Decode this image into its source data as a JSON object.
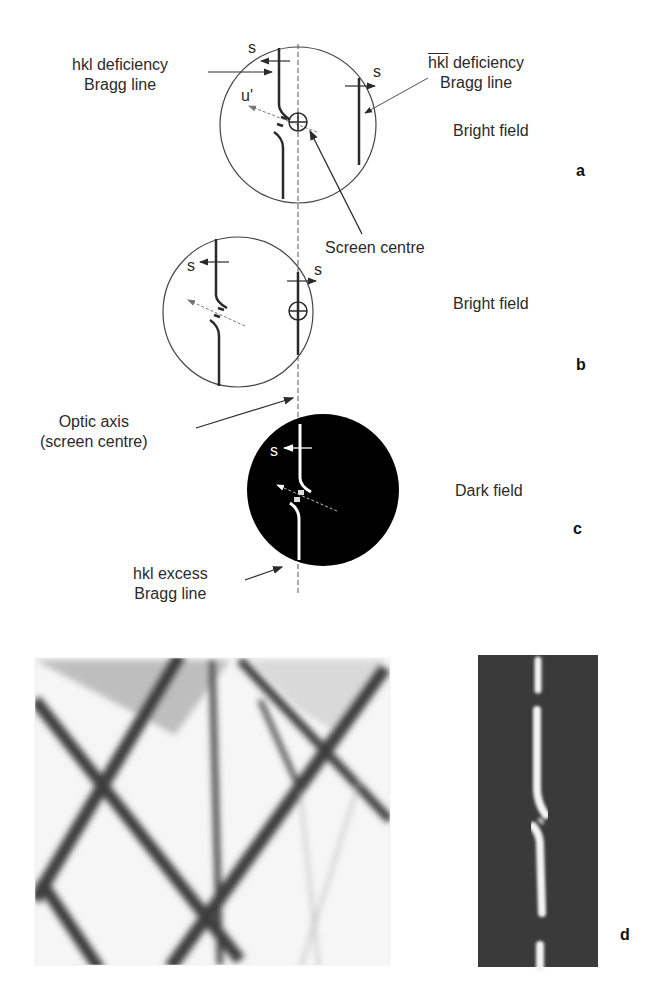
{
  "figure": {
    "panel_a": {
      "letter": "a",
      "mode": "Bright field",
      "left_label_line1": "hkl deficiency",
      "left_label_line2": "Bragg line",
      "right_label_hkl": "hkl",
      "right_label_rest": " deficiency",
      "right_label_line2": "Bragg line",
      "s_left": "s",
      "s_right": "s",
      "u_label": "u'",
      "screen_centre": "Screen centre"
    },
    "panel_b": {
      "letter": "b",
      "mode": "Bright field",
      "s_left": "s",
      "s_right": "s",
      "optic_axis_line1": "Optic axis",
      "optic_axis_line2": "(screen centre)"
    },
    "panel_c": {
      "letter": "c",
      "mode": "Dark field",
      "s_label": "s",
      "excess_line1": "hkl excess",
      "excess_line2": "Bragg line"
    },
    "panel_d": {
      "letter": "d"
    },
    "colors": {
      "line": "#2a2a2a",
      "dark_field": "#000000",
      "micrograph_dark": "#3a3a3a",
      "micrograph_bg": "#f4f4f4"
    }
  }
}
